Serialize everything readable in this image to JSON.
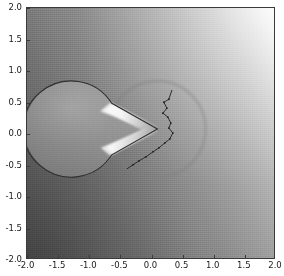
{
  "figure": {
    "background": "#ffffff",
    "plot_background_dark": "#4f4f4f",
    "plot_background_light": "#fbfbfb",
    "outline_color": "#2e2e2e",
    "mesh_line_color": "#1f1f1f"
  },
  "chart_data": {
    "type": "heatmap",
    "title": "",
    "xlabel": "",
    "ylabel": "",
    "xlim": [
      -2.0,
      2.0
    ],
    "ylim": [
      -2.0,
      2.0
    ],
    "grid": false,
    "legend": "none",
    "colormap": "gray",
    "xticks": [
      -2.0,
      -1.5,
      -1.0,
      -0.5,
      0.0,
      0.5,
      1.0,
      1.5,
      2.0
    ],
    "yticks": [
      -2.0,
      -1.5,
      -1.0,
      -0.5,
      0.0,
      0.5,
      1.0,
      1.5,
      2.0
    ],
    "xticklabels": [
      "-2.0",
      "-1.5",
      "-1.0",
      "-0.5",
      "0.0",
      "0.5",
      "1.0",
      "1.5",
      "2.0"
    ],
    "yticklabels": [
      "-2.0",
      "-1.5",
      "-1.0",
      "-0.5",
      "0.0",
      "0.5",
      "1.0",
      "1.5",
      "2.0"
    ],
    "field_gradient_direction_deg": 60,
    "field_min_corner": "bottom-left",
    "field_max_corner": "top-right",
    "obstacle": {
      "shape": "pacman-circle",
      "center": [
        0.06,
        0.04
      ],
      "radius": 0.76,
      "wedge_opening_side": "left",
      "wedge_half_angle_deg": 30,
      "wedge_tip": [
        0.06,
        0.04
      ],
      "wedge_upper_point": [
        -0.63,
        0.42
      ],
      "wedge_lower_point": [
        -0.63,
        -0.34
      ],
      "interior_bright": true
    },
    "mesh_polyline": {
      "label": "interface-mesh-edge",
      "points": [
        [
          0.24,
          0.62
        ],
        [
          0.19,
          0.49
        ],
        [
          0.12,
          0.45
        ],
        [
          0.16,
          0.37
        ],
        [
          0.11,
          0.31
        ],
        [
          0.18,
          0.25
        ],
        [
          0.23,
          0.17
        ],
        [
          0.2,
          0.09
        ],
        [
          0.26,
          0.02
        ],
        [
          0.21,
          -0.06
        ],
        [
          0.13,
          -0.12
        ],
        [
          0.04,
          -0.18
        ],
        [
          -0.06,
          -0.24
        ],
        [
          -0.17,
          -0.3
        ],
        [
          -0.28,
          -0.37
        ],
        [
          -0.38,
          -0.44
        ],
        [
          -0.48,
          -0.51
        ]
      ]
    }
  }
}
